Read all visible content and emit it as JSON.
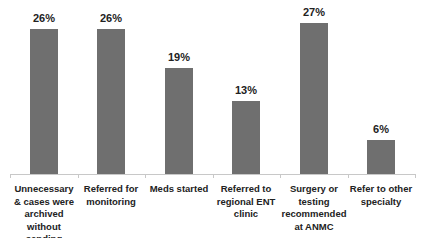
{
  "chart_data": {
    "type": "bar",
    "title": "",
    "xlabel": "",
    "ylabel": "",
    "ylim": [
      0,
      30
    ],
    "grid": false,
    "legend": null,
    "categories": [
      "Unnecessary & cases were archived without sending",
      "Referred for monitoring",
      "Meds started",
      "Referred to regional ENT clinic",
      "Surgery or testing recommended at ANMC",
      "Refer to other specialty"
    ],
    "values": [
      26,
      26,
      19,
      13,
      27,
      6
    ],
    "value_labels": [
      "26%",
      "26%",
      "19%",
      "13%",
      "27%",
      "6%"
    ],
    "bar_color": "#6f6f6f"
  }
}
